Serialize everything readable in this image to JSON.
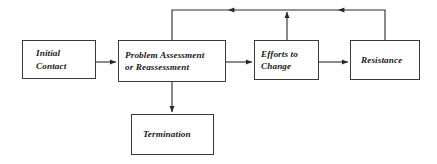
{
  "diagram": {
    "line_color": "#3a3a3a",
    "box_fill": "#ffffff",
    "text_color": "#1a1a1a",
    "nodes": [
      {
        "id": "initial-contact",
        "label_line1": "Initial",
        "label_line2": "Contact",
        "x": 22,
        "y": 40,
        "width": 74,
        "height": 39
      },
      {
        "id": "problem-assessment",
        "label_line1": "Problem Assessment",
        "label_line2": "or Reassessment",
        "x": 118,
        "y": 40,
        "width": 108,
        "height": 42
      },
      {
        "id": "efforts-to-change",
        "label_line1": "Efforts to",
        "label_line2": "Change",
        "x": 254,
        "y": 40,
        "width": 65,
        "height": 40
      },
      {
        "id": "resistance",
        "label_line1": "Resistance",
        "label_line2": "",
        "x": 350,
        "y": 40,
        "width": 70,
        "height": 40
      },
      {
        "id": "termination",
        "label_line1": "Termination",
        "label_line2": "",
        "x": 131,
        "y": 114,
        "width": 83,
        "height": 41
      }
    ],
    "edges": [
      {
        "id": "initial-to-problem",
        "from": "initial-contact",
        "to": "problem-assessment",
        "kind": "horizontal-arrow"
      },
      {
        "id": "problem-to-efforts",
        "from": "problem-assessment",
        "to": "efforts-to-change",
        "kind": "horizontal-arrow"
      },
      {
        "id": "efforts-to-resistance",
        "from": "efforts-to-change",
        "to": "resistance",
        "kind": "horizontal-arrow"
      },
      {
        "id": "problem-to-termination",
        "from": "problem-assessment",
        "to": "termination",
        "kind": "vertical-arrow-down"
      },
      {
        "id": "resistance-to-problem",
        "from": "resistance",
        "to": "problem-assessment",
        "kind": "feedback-top-left"
      },
      {
        "id": "resistance-to-efforts",
        "from": "resistance",
        "to": "efforts-to-change",
        "kind": "feedback-top-up"
      }
    ]
  }
}
